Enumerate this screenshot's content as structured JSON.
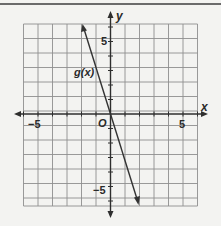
{
  "chart_data": {
    "type": "line",
    "title": "",
    "xlabel": "x",
    "ylabel": "y",
    "xlim": [
      -6,
      6
    ],
    "ylim": [
      -6.5,
      6
    ],
    "grid": true,
    "x_tick_labels": [
      "-5",
      "5"
    ],
    "y_tick_labels": [
      "5",
      "-5"
    ],
    "origin_label": "O",
    "series": [
      {
        "name": "g(x)",
        "x": [
          -1.9,
          1.9
        ],
        "y": [
          5.8,
          -5.8
        ],
        "equation": "g(x) = -3x"
      }
    ],
    "annotations": [
      {
        "text": "g(x)",
        "x": -2.8,
        "y": 2.9
      }
    ]
  },
  "labels": {
    "x_axis": "x",
    "y_axis": "y",
    "origin": "O",
    "x_neg5": "−5",
    "x_pos5": "5",
    "y_pos5": "5",
    "y_neg5": "−5",
    "curve": "g(x)"
  },
  "colors": {
    "background": "#f3f3f1",
    "grid": "#8f8f8f",
    "axis": "#2e2e2e",
    "line": "#333333"
  }
}
